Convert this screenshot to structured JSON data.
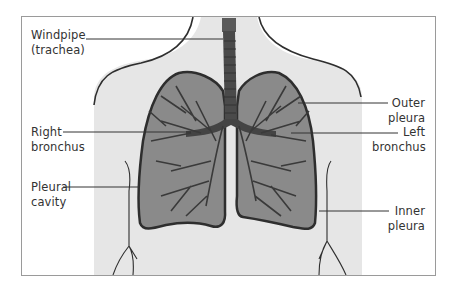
{
  "diagram": {
    "colors": {
      "torso_fill": "#e6e6e6",
      "lung_fill": "#8a8a8a",
      "outline": "#2e2e2e",
      "airway": "#4a4a4a",
      "label_text": "#333333"
    },
    "labels": {
      "windpipe": {
        "line1": "Windpipe",
        "line2": "(trachea)"
      },
      "right_bronchus": {
        "line1": "Right",
        "line2": "bronchus"
      },
      "pleural_cavity": {
        "line1": "Pleural",
        "line2": "cavity"
      },
      "outer_pleura": {
        "line1": "Outer",
        "line2": "pleura"
      },
      "left_bronchus": {
        "line1": "Left",
        "line2": "bronchus"
      },
      "inner_pleura": {
        "line1": "Inner",
        "line2": "pleura"
      }
    }
  }
}
